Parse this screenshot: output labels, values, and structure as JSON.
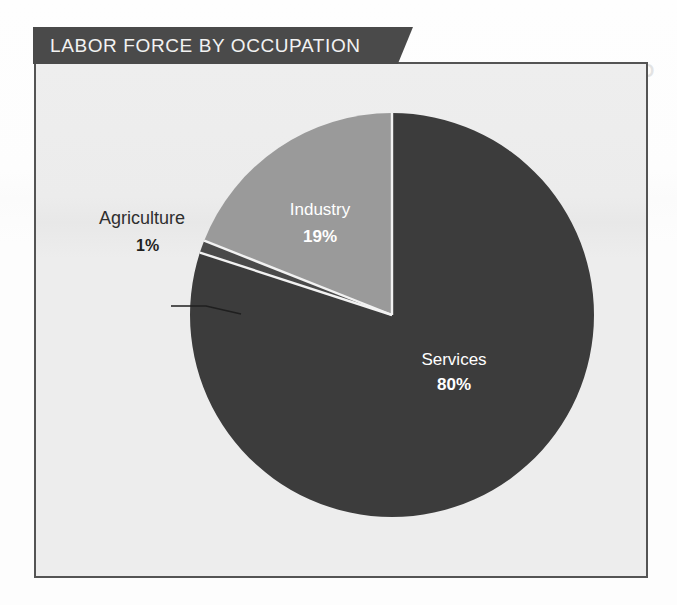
{
  "banner": {
    "title": "LABOR FORCE BY OCCUPATION"
  },
  "artifact": {
    "ghost_text": "VOTES IN THE LOWER HOUSE"
  },
  "colors": {
    "banner_bg": "#4a4a4a",
    "frame_border": "#545454",
    "frame_bg": "#ececec",
    "services": "#3c3c3c",
    "industry": "#9a9a9a",
    "agriculture": "#4a4a4a",
    "divider": "#f2f2f2",
    "label_on_slice": "#ffffff",
    "callout_text": "#2f2f2f"
  },
  "chart_data": {
    "type": "pie",
    "title": "LABOR FORCE BY OCCUPATION",
    "categories": [
      "Services",
      "Agriculture",
      "Industry"
    ],
    "values": [
      80,
      19,
      1
    ],
    "unit": "%",
    "start_angle_deg": 0,
    "direction": "clockwise",
    "legend": "none",
    "slices": [
      {
        "name": "Services",
        "value": 80,
        "value_label": "80%",
        "color": "#3c3c3c",
        "label_placement": "inside",
        "label_x": 452,
        "label_y": 363,
        "pct_x": 452,
        "pct_y": 388
      },
      {
        "name": "Industry",
        "value": 19,
        "value_label": "19%",
        "color": "#9a9a9a",
        "label_placement": "inside",
        "label_x": 318,
        "label_y": 213,
        "pct_x": 318,
        "pct_y": 240
      },
      {
        "name": "Agriculture",
        "value": 1,
        "value_label": "1%",
        "color": "#4a4a4a",
        "label_placement": "callout",
        "label_x": 97,
        "label_y": 222,
        "pct_x": 134,
        "pct_y": 249
      }
    ],
    "geometry": {
      "center_x": 390,
      "center_y": 313,
      "radius": 202
    }
  }
}
